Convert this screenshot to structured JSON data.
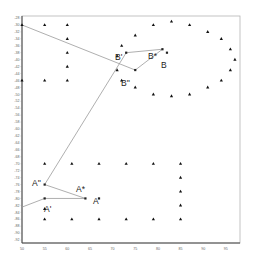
{
  "chart_data": {
    "type": "scatter",
    "title": "",
    "xlabel": "",
    "ylabel": "",
    "xlim": [
      50,
      98
    ],
    "ylim": [
      -92,
      -28
    ],
    "grid": false,
    "legend": null,
    "x_ticks": [
      50,
      55,
      60,
      65,
      70,
      75,
      80,
      85,
      90,
      95
    ],
    "y_ticks": [
      -28,
      -30,
      -32,
      -34,
      -36,
      -38,
      -40,
      -42,
      -44,
      -46,
      -48,
      -50,
      -52,
      -54,
      -56,
      -58,
      -60,
      -62,
      -64,
      -66,
      -68,
      -70,
      -72,
      -74,
      -76,
      -78,
      -80,
      -82,
      -84,
      -86,
      -88,
      -90,
      -92
    ],
    "series": [
      {
        "name": "grid-points-left",
        "marker": "triangle",
        "points": [
          [
            50,
            -30
          ],
          [
            55,
            -30
          ],
          [
            60,
            -30
          ],
          [
            60,
            -34
          ],
          [
            60,
            -38
          ],
          [
            60,
            -42
          ],
          [
            50,
            -46
          ],
          [
            55,
            -46
          ],
          [
            60,
            -46
          ]
        ]
      },
      {
        "name": "grid-points-rectangle",
        "marker": "triangle",
        "points": [
          [
            55,
            -70
          ],
          [
            61,
            -70
          ],
          [
            67,
            -70
          ],
          [
            73,
            -70
          ],
          [
            79,
            -70
          ],
          [
            85,
            -70
          ],
          [
            85,
            -74
          ],
          [
            85,
            -78
          ],
          [
            85,
            -82
          ],
          [
            55,
            -86
          ],
          [
            61,
            -86
          ],
          [
            67,
            -86
          ],
          [
            73,
            -86
          ],
          [
            79,
            -86
          ],
          [
            85,
            -86
          ],
          [
            55,
            -83
          ]
        ]
      },
      {
        "name": "grid-points-ellipse",
        "marker": "triangle",
        "points": [
          [
            79,
            -30
          ],
          [
            83,
            -29
          ],
          [
            87,
            -30
          ],
          [
            91,
            -32
          ],
          [
            94,
            -34
          ],
          [
            96,
            -37
          ],
          [
            97,
            -40
          ],
          [
            96,
            -43
          ],
          [
            94,
            -46
          ],
          [
            91,
            -48
          ],
          [
            87,
            -50
          ],
          [
            83,
            -50.5
          ],
          [
            79,
            -50
          ],
          [
            75,
            -48
          ],
          [
            72,
            -46
          ],
          [
            71,
            -43
          ],
          [
            71,
            -39
          ],
          [
            72,
            -36
          ],
          [
            75,
            -33
          ]
        ]
      }
    ],
    "annotations": [
      {
        "label": "A'",
        "x": 55,
        "y": -80
      },
      {
        "label": "A''",
        "x": 55,
        "y": -76
      },
      {
        "label": "A*",
        "x": 64,
        "y": -80
      },
      {
        "label": "A",
        "x": 67,
        "y": -80
      },
      {
        "label": "B'",
        "x": 73,
        "y": -38
      },
      {
        "label": "B''",
        "x": 75,
        "y": -43
      },
      {
        "label": "B*",
        "x": 81,
        "y": -37
      },
      {
        "label": "B",
        "x": 82,
        "y": -38
      }
    ],
    "lines": [
      {
        "from": [
          50,
          -30
        ],
        "to": [
          75,
          -43
        ]
      },
      {
        "from": [
          55,
          -80
        ],
        "to": [
          50,
          -82.5
        ]
      },
      {
        "from": [
          55,
          -80
        ],
        "to": [
          64,
          -80
        ]
      },
      {
        "from": [
          55,
          -76
        ],
        "to": [
          64,
          -80
        ]
      },
      {
        "from": [
          55,
          -76
        ],
        "to": [
          73,
          -38
        ]
      },
      {
        "from": [
          73,
          -38
        ],
        "to": [
          81,
          -37
        ]
      },
      {
        "from": [
          75,
          -43
        ],
        "to": [
          81,
          -37
        ]
      }
    ]
  },
  "labels": {
    "A_prime": "A'",
    "A_dprime": "A''",
    "A_star": "A*",
    "A": "A",
    "B_prime": "B'",
    "B_dprime": "B''",
    "B_star": "B*",
    "B": "B"
  },
  "colors": {
    "marker": "#111111",
    "line": "#9a9a9a",
    "frame": "#b5b5b5",
    "axis": "#444444"
  }
}
